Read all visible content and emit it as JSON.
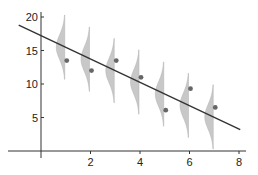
{
  "chart_data": {
    "type": "scatter",
    "title": "",
    "xlabel": "",
    "ylabel": "",
    "xlim": [
      -1.6,
      8.2
    ],
    "ylim": [
      -3.5,
      21
    ],
    "x_ticks": [
      2,
      4,
      6,
      8
    ],
    "x_tick_labels": [
      "2",
      "4",
      "6",
      "8"
    ],
    "y_ticks": [
      5,
      10,
      15,
      20
    ],
    "y_tick_labels": [
      "5",
      "10",
      "15",
      "20"
    ],
    "grid": false,
    "legend": null,
    "series": [
      {
        "name": "observations",
        "kind": "points",
        "x": [
          1,
          2,
          3,
          4,
          5,
          6,
          7
        ],
        "y": [
          13.5,
          12.0,
          13.5,
          11.0,
          6.1,
          9.3,
          6.5
        ],
        "color": "#666666"
      },
      {
        "name": "regression line",
        "kind": "line",
        "x": [
          -0.9,
          8.05
        ],
        "y": [
          18.8,
          3.2
        ],
        "slope": -1.73,
        "intercept": 17.2,
        "color": "#333333"
      },
      {
        "name": "predictive distributions",
        "kind": "half-violin",
        "x": [
          1,
          2,
          3,
          4,
          5,
          6,
          7
        ],
        "center": [
          15.5,
          13.7,
          12.0,
          10.3,
          8.5,
          6.8,
          5.1
        ],
        "spread": 4.8,
        "color": "#c8c8c8"
      }
    ]
  }
}
